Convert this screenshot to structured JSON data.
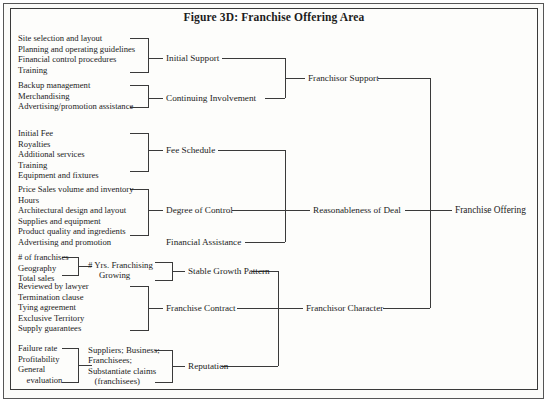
{
  "figure": {
    "title": "Figure 3D: Franchise Offering Area",
    "root_label": "Franchise Offering",
    "background_color": "#fdfdfb",
    "line_color": "#3a3a3a",
    "text_color": "#1c1c1c"
  },
  "branches": {
    "franchisor_support": {
      "label": "Franchisor Support",
      "children": [
        {
          "label": "Initial Support",
          "items": [
            "Site selection and layout",
            "Planning and operating guidelines",
            "Financial control procedures",
            "Training"
          ]
        },
        {
          "label": "Continuing Involvement",
          "items": [
            "Backup management",
            "Merchandising",
            "Advertising/promotion assistance"
          ]
        }
      ]
    },
    "reasonableness_of_deal": {
      "label": "Reasonableness of Deal",
      "children": [
        {
          "label": "Fee Schedule",
          "items": [
            "Initial Fee",
            "Royalties",
            "Additional services",
            "Training",
            "Equipment and fixtures"
          ]
        },
        {
          "label": "Degree of Control",
          "items": [
            "Price Sales volume and inventory",
            "Hours",
            "Architectural design and layout",
            "Supplies and equipment",
            "Product quality and ingredients",
            "Advertising and promotion"
          ]
        },
        {
          "label": "Financial Assistance",
          "items": []
        }
      ]
    },
    "franchisor_character": {
      "label": "Franchisor Character",
      "children": [
        {
          "label": "Stable Growth Pattern",
          "mid_label": "# Yrs. Franchising\n     Growing",
          "items": [
            "# of franchises",
            "Geography",
            "Total sales"
          ]
        },
        {
          "label": "Franchise Contract",
          "items": [
            "Reviewed by lawyer",
            "Termination clause",
            "Tying agreement",
            "Exclusive Territory",
            "Supply guarantees"
          ]
        },
        {
          "label": "Reputation",
          "mid_label": "Suppliers; Business;\nFranchisees;\nSubstantiate claims\n   (franchisees)",
          "items": [
            "Failure rate",
            "Profitability",
            "General",
            "    evaluation"
          ]
        }
      ]
    }
  }
}
